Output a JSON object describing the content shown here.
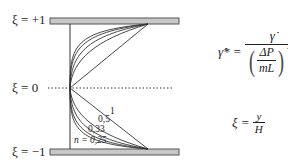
{
  "labels": {
    "xi_top": "ξ = +1",
    "xi_mid": "ξ = 0",
    "xi_bot": "ξ = −1"
  },
  "formula_shear": {
    "lhs": "γ̇* =",
    "numerator": "γ̇",
    "inner_num": "ΔP",
    "inner_den": "mL",
    "exponent": "1/n"
  },
  "formula_xi": {
    "lhs": "ξ =",
    "numerator": "y",
    "denominator": "H"
  },
  "curve_labels": [
    "1",
    "0,5",
    "0,33",
    "n = 0,25"
  ],
  "colors": {
    "plate_fill": "#c8c8c8",
    "plate_stroke": "#555555",
    "line": "#333333"
  }
}
